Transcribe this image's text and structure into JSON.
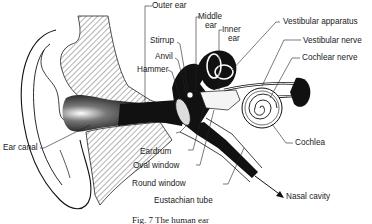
{
  "figure": {
    "caption": "Fig. 7 The human ear",
    "labels": {
      "outer_ear": "Outer ear",
      "middle_ear_1": "Middle",
      "middle_ear_2": "ear",
      "inner_ear_1": "Inner",
      "inner_ear_2": "ear",
      "stirrup": "Stirrup",
      "anvil": "Anvil",
      "hammer": "Hammer",
      "vestibular_apparatus": "Vestibular apparatus",
      "vestibular_nerve": "Vestibular nerve",
      "cochlear_nerve": "Cochlear nerve",
      "ear_canal": "Ear canal",
      "cochlea": "Cochlea",
      "eardrum": "Eardrum",
      "oval_window": "Oval window",
      "round_window": "Round window",
      "eustachian_tube": "Eustachian tube",
      "nasal_cavity": "Nasal cavity"
    },
    "colors": {
      "ink": "#111111",
      "background": "#ffffff",
      "hatch": "#555555"
    }
  }
}
